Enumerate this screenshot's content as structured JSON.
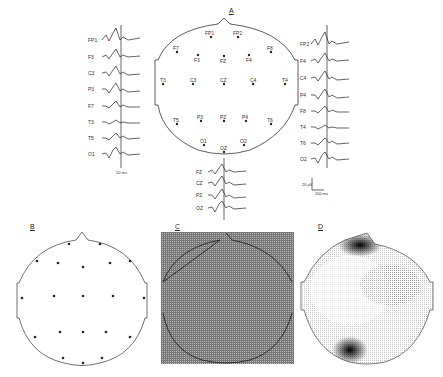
{
  "panels": {
    "A": {
      "letter": "A",
      "left_channels": [
        "FP1",
        "F3",
        "C3",
        "P3",
        "F7",
        "T3",
        "T5",
        "O1"
      ],
      "right_channels": [
        "FP2",
        "F4",
        "C4",
        "P4",
        "F8",
        "T4",
        "T6",
        "O2"
      ],
      "mid_channels": [
        "FZ",
        "CZ",
        "PZ",
        "OZ"
      ],
      "electrodes": [
        "FP1",
        "FP2",
        "F7",
        "F3",
        "FZ",
        "F4",
        "F8",
        "T3",
        "C3",
        "CZ",
        "C4",
        "T4",
        "T5",
        "P3",
        "PZ",
        "P4",
        "T6",
        "O1",
        "OZ",
        "O2"
      ],
      "time_marker": "10 ms",
      "scale_v": "20 µV",
      "scale_t": "200 ms"
    },
    "B": {
      "letter": "B",
      "caption": "Electrode value map"
    },
    "C": {
      "letter": "C",
      "caption": "Interpolation grid"
    },
    "D": {
      "letter": "D",
      "caption": "Topographic map"
    }
  },
  "colors": {
    "ink": "#222222",
    "grid": "#888888",
    "background": "#ffffff"
  }
}
